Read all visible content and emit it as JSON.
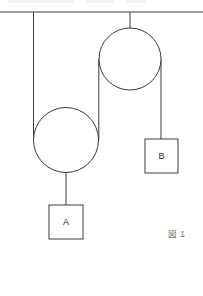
{
  "figure": {
    "caption": "図 1",
    "diagram_type": "pulley-system",
    "colors": {
      "stroke": "#3b3b3f",
      "background": "#ffffff",
      "label": "#2a2a2e",
      "caption": "#6d6d72"
    },
    "ceiling": {
      "label": "ceiling-support-line",
      "y": 12,
      "x_start": 0,
      "x_end": 203
    },
    "pulleys": [
      {
        "name": "upper-fixed-pulley",
        "cx": 130,
        "cy": 59,
        "r": 31,
        "axle_top_y": 12,
        "axle_bottom_y": 59
      },
      {
        "name": "lower-movable-pulley",
        "cx": 66,
        "cy": 140,
        "r": 32.5,
        "axle_top_y": 140,
        "axle_bottom_y": 205
      }
    ],
    "blocks": [
      {
        "name": "block-a",
        "label": "A",
        "x": 49,
        "y": 205,
        "width": 34,
        "height": 34,
        "rope_x": 66,
        "rope_from_y": 140
      },
      {
        "name": "block-b",
        "label": "B",
        "x": 145,
        "y": 139,
        "width": 33,
        "height": 34,
        "rope_x": 161,
        "rope_from_y": 59
      }
    ],
    "ropes": [
      {
        "name": "rope-ceiling-to-lower-pulley-left",
        "x": 33.5,
        "y_start": 12,
        "y_end": 140
      },
      {
        "name": "rope-lower-pulley-right-to-upper-pulley-left",
        "x": 98.8,
        "y_start": 59,
        "y_end": 140
      },
      {
        "name": "rope-upper-pulley-right-to-block-b",
        "x": 161,
        "y_start": 59,
        "y_end": 139
      },
      {
        "name": "rope-lower-pulley-to-block-a",
        "x": 66,
        "y_start": 140,
        "y_end": 205
      }
    ]
  }
}
